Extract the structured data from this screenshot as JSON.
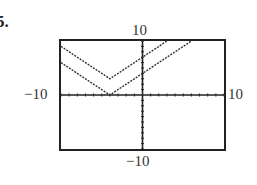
{
  "problem": {
    "number": "5."
  },
  "window": {
    "xmin_label": "−10",
    "xmax_label": "10",
    "ymin_label": "−10",
    "ymax_label": "10"
  },
  "chart_data": {
    "type": "line",
    "title": "",
    "xlabel": "",
    "ylabel": "",
    "xlim": [
      -10,
      10
    ],
    "ylim": [
      -10,
      10
    ],
    "xscl": 1,
    "yscl": 1,
    "grid": false,
    "tick_labels": {
      "x": [
        "−10",
        "10"
      ],
      "y": [
        "−10",
        "10"
      ]
    },
    "series": [
      {
        "name": "y = |x + 4|",
        "style": "dotted",
        "x": [
          -10,
          -4,
          6
        ],
        "y": [
          6,
          0,
          10
        ]
      },
      {
        "name": "y = |x + 4| + 3",
        "style": "dotted",
        "x": [
          -10,
          -4,
          3
        ],
        "y": [
          9,
          3,
          10
        ]
      }
    ]
  }
}
